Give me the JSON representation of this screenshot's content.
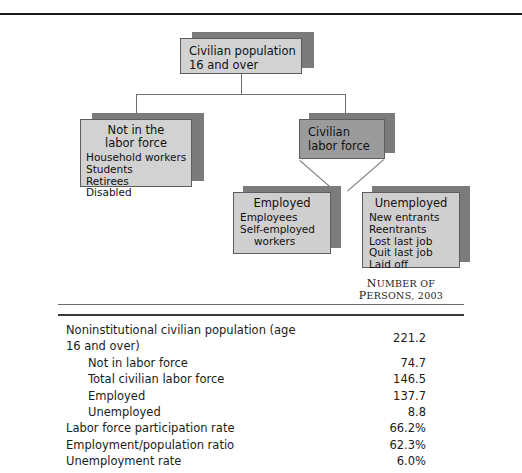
{
  "diagram": {
    "nodes": {
      "root": {
        "title": "Civilian population",
        "title2": "16 and over"
      },
      "nilf": {
        "title": "Not in the",
        "title2": "labor force",
        "items": [
          "Household workers",
          "Students",
          "Retirees",
          "Disabled"
        ]
      },
      "clf": {
        "title": "Civilian",
        "title2": "labor force"
      },
      "employed": {
        "title": "Employed",
        "items": [
          "Employees",
          "Self-employed",
          "workers"
        ]
      },
      "unemployed": {
        "title": "Unemployed",
        "items": [
          "New entrants",
          "Reentrants",
          "Lost last job",
          "Quit last job",
          "Laid off"
        ]
      }
    }
  },
  "table": {
    "column_header_line1": "Number of",
    "column_header_line2": "Persons, 2003",
    "rows": [
      {
        "label": "Noninstitutional civilian population (age 16 and over)",
        "value": "221.2",
        "indent": 0
      },
      {
        "label": "Not in labor force",
        "value": "74.7",
        "indent": 1
      },
      {
        "label": "Total civilian labor force",
        "value": "146.5",
        "indent": 1
      },
      {
        "label": "Employed",
        "value": "137.7",
        "indent": 1
      },
      {
        "label": "Unemployed",
        "value": "8.8",
        "indent": 1
      },
      {
        "label": "Labor force participation rate",
        "value": "66.2%",
        "indent": 0
      },
      {
        "label": "Employment/population ratio",
        "value": "62.3%",
        "indent": 0
      },
      {
        "label": "Unemployment rate",
        "value": "6.0%",
        "indent": 0
      }
    ]
  },
  "colors": {
    "box_light": "#d2d2d2",
    "box_mid": "#9b9b9b",
    "shadow": "#7b7b7b",
    "rule_dark": "#1a1a1a"
  }
}
